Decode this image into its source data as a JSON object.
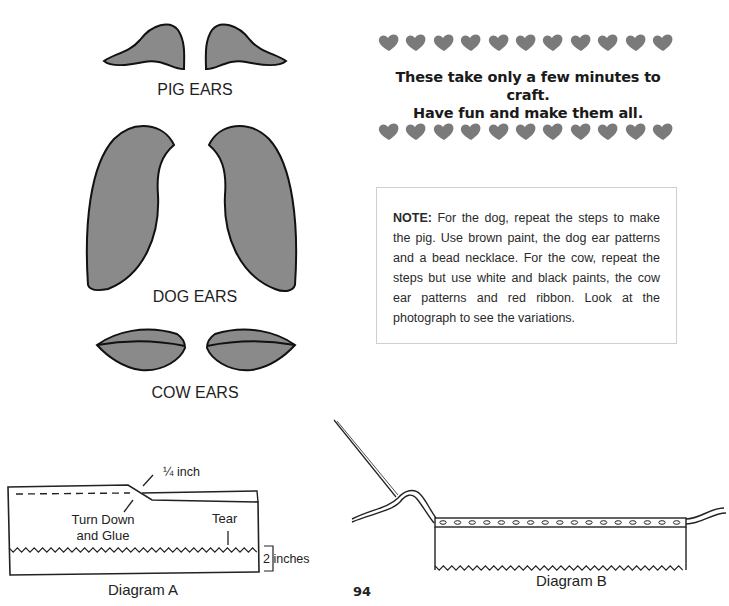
{
  "ear_patterns": {
    "pig": {
      "label": "PIG EARS"
    },
    "dog": {
      "label": "DOG EARS"
    },
    "cow": {
      "label": "COW EARS"
    },
    "fill_color": "#8a8a8a",
    "stroke_color": "#111111"
  },
  "tagline": {
    "line1": "These take only a few minutes to craft.",
    "line2": "Have fun and make them all.",
    "heart_count_per_row": 11,
    "heart_color": "#7a7a7a"
  },
  "note": {
    "heading": "NOTE:",
    "body": "For the dog, repeat the steps to make the pig. Use brown paint, the dog ear patterns and a bead necklace. For the cow, repeat the steps but use white and black paints, the cow ear patterns and red ribbon. Look at the photograph to see the variations."
  },
  "diagram_a": {
    "caption": "Diagram A",
    "annotations": {
      "fold": "¼ inch",
      "turn_down": "Turn Down",
      "and_glue": "and Glue",
      "tear": "Tear",
      "measure": "2 inches"
    }
  },
  "diagram_b": {
    "caption": "Diagram B"
  },
  "page_number": "94"
}
